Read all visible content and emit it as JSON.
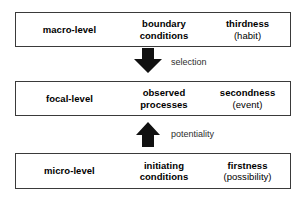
{
  "diagram": {
    "text_color": "#000000",
    "label_color": "#2e2e2e",
    "border_color": "#3a3a3a",
    "background": "#ffffff",
    "levels": [
      {
        "id": "macro",
        "level_label": "macro-level",
        "middle_line1": "boundary",
        "middle_line2": "conditions",
        "category_name": "thirdness",
        "category_note": "(habit)"
      },
      {
        "id": "focal",
        "level_label": "focal-level",
        "middle_line1": "observed",
        "middle_line2": "processes",
        "category_name": "secondness",
        "category_note": "(event)"
      },
      {
        "id": "micro",
        "level_label": "micro-level",
        "middle_line1": "initiating",
        "middle_line2": "conditions",
        "category_name": "firstness",
        "category_note": "(possibility)"
      }
    ],
    "arrows": [
      {
        "id": "selection",
        "label": "selection",
        "direction": "down",
        "icon": "arrow-down-icon",
        "from": "macro-level",
        "to": "focal-level"
      },
      {
        "id": "potentiality",
        "label": "potentiality",
        "direction": "up",
        "icon": "arrow-up-icon",
        "from": "micro-level",
        "to": "focal-level"
      }
    ]
  }
}
